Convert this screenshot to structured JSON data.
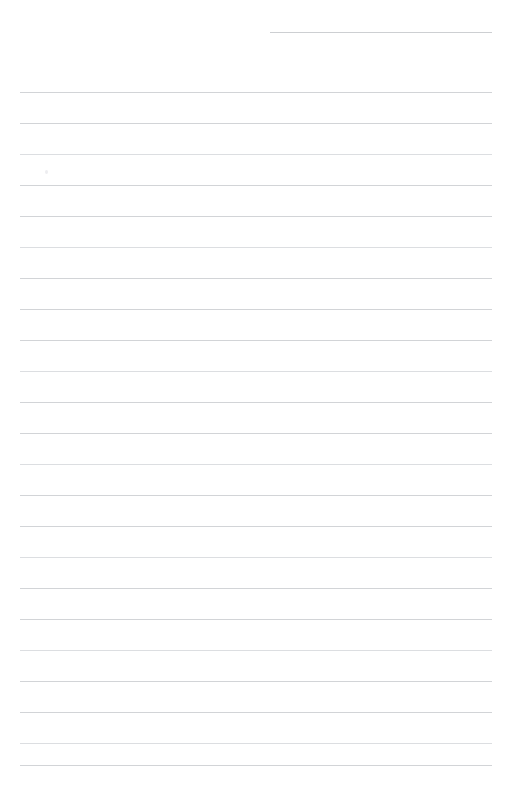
{
  "page": {
    "kind": "lined-paper",
    "width": 509,
    "height": 797,
    "background_color": "#ffffff",
    "rule_color": "#d2d4d7",
    "content_text": "",
    "line_count": 23,
    "line_spacing_px": 31
  },
  "header_rule": {
    "name": "header-rule",
    "x": 270,
    "y": 32,
    "width": 222,
    "color": "#cdcfd2"
  },
  "rules": [
    {
      "index": 1,
      "y": 92,
      "x": 20,
      "width": 472,
      "tone": "normal"
    },
    {
      "index": 2,
      "y": 123,
      "x": 20,
      "width": 472,
      "tone": "normal"
    },
    {
      "index": 3,
      "y": 154,
      "x": 20,
      "width": 472,
      "tone": "faint"
    },
    {
      "index": 4,
      "y": 185,
      "x": 20,
      "width": 472,
      "tone": "normal"
    },
    {
      "index": 5,
      "y": 216,
      "x": 20,
      "width": 472,
      "tone": "normal"
    },
    {
      "index": 6,
      "y": 247,
      "x": 20,
      "width": 472,
      "tone": "faint"
    },
    {
      "index": 7,
      "y": 278,
      "x": 20,
      "width": 472,
      "tone": "normal"
    },
    {
      "index": 8,
      "y": 309,
      "x": 20,
      "width": 472,
      "tone": "normal"
    },
    {
      "index": 9,
      "y": 340,
      "x": 20,
      "width": 472,
      "tone": "normal"
    },
    {
      "index": 10,
      "y": 371,
      "x": 20,
      "width": 472,
      "tone": "faint"
    },
    {
      "index": 11,
      "y": 402,
      "x": 20,
      "width": 472,
      "tone": "normal"
    },
    {
      "index": 12,
      "y": 433,
      "x": 20,
      "width": 472,
      "tone": "normal"
    },
    {
      "index": 13,
      "y": 464,
      "x": 20,
      "width": 472,
      "tone": "faint"
    },
    {
      "index": 14,
      "y": 495,
      "x": 20,
      "width": 472,
      "tone": "normal"
    },
    {
      "index": 15,
      "y": 526,
      "x": 20,
      "width": 472,
      "tone": "normal"
    },
    {
      "index": 16,
      "y": 557,
      "x": 20,
      "width": 472,
      "tone": "faint"
    },
    {
      "index": 17,
      "y": 588,
      "x": 20,
      "width": 472,
      "tone": "normal"
    },
    {
      "index": 18,
      "y": 619,
      "x": 20,
      "width": 472,
      "tone": "normal"
    },
    {
      "index": 19,
      "y": 650,
      "x": 20,
      "width": 472,
      "tone": "faint"
    },
    {
      "index": 20,
      "y": 681,
      "x": 20,
      "width": 472,
      "tone": "normal"
    },
    {
      "index": 21,
      "y": 712,
      "x": 20,
      "width": 472,
      "tone": "normal"
    },
    {
      "index": 22,
      "y": 743,
      "x": 20,
      "width": 472,
      "tone": "faint"
    },
    {
      "index": 23,
      "y": 765,
      "x": 20,
      "width": 472,
      "tone": "normal"
    }
  ],
  "marks": [
    {
      "name": "paper-speck",
      "x": 45,
      "y": 170,
      "color": "#ededf0"
    }
  ]
}
